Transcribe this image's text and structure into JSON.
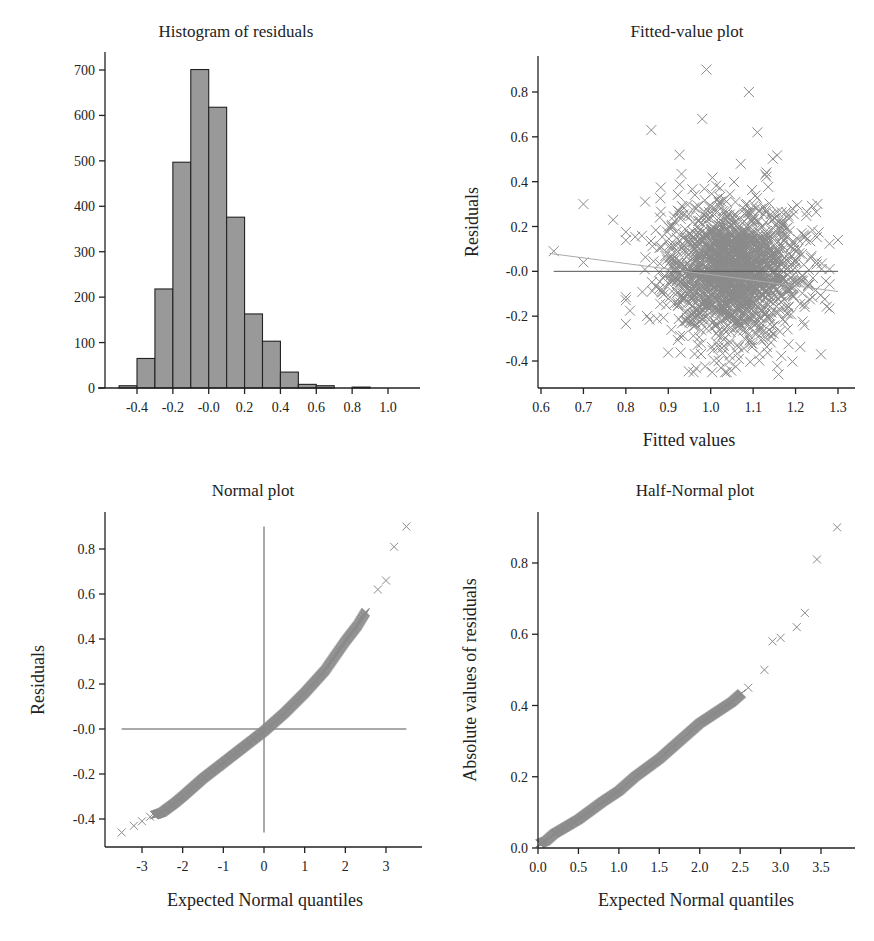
{
  "chart_data": [
    {
      "id": "histogram",
      "type": "bar",
      "title": "Histogram of residuals",
      "xlabel": "",
      "ylabel": "",
      "bin_edges": [
        -0.5,
        -0.4,
        -0.3,
        -0.2,
        -0.1,
        0.0,
        0.1,
        0.2,
        0.3,
        0.4,
        0.5,
        0.6,
        0.7,
        0.8,
        0.9
      ],
      "categories": [
        "-0.5 to -0.4",
        "-0.4 to -0.3",
        "-0.3 to -0.2",
        "-0.2 to -0.1",
        "-0.1 to 0.0",
        "0.0 to 0.1",
        "0.1 to 0.2",
        "0.2 to 0.3",
        "0.3 to 0.4",
        "0.4 to 0.5",
        "0.5 to 0.6",
        "0.6 to 0.7",
        "0.7 to 0.8",
        "0.8 to 0.9"
      ],
      "values": [
        5,
        65,
        218,
        497,
        701,
        618,
        376,
        163,
        103,
        35,
        8,
        5,
        0,
        2
      ],
      "xticks": [
        "-0.4",
        "-0.2",
        "-0.0",
        "0.2",
        "0.4",
        "0.6",
        "0.8",
        "1.0"
      ],
      "yticks": [
        "0",
        "100",
        "200",
        "300",
        "400",
        "500",
        "600",
        "700"
      ],
      "xlim": [
        -0.55,
        1.15
      ],
      "ylim": [
        0,
        740
      ],
      "grid": false
    },
    {
      "id": "fitted",
      "type": "scatter",
      "title": "Fitted-value plot",
      "xlabel": "Fitted values",
      "ylabel": "Residuals",
      "xticks": [
        "0.6",
        "0.7",
        "0.8",
        "0.9",
        "1.0",
        "1.1",
        "1.2",
        "1.3"
      ],
      "yticks": [
        "-0.4",
        "-0.2",
        "-0.0",
        "0.2",
        "0.4",
        "0.6",
        "0.8"
      ],
      "xlim": [
        0.59,
        1.34
      ],
      "ylim": [
        -0.53,
        0.97
      ],
      "marker": "x",
      "reference_line": {
        "y": 0.0,
        "x_from": 0.63,
        "x_to": 1.3
      },
      "trend_line": {
        "x": [
          0.62,
          1.3
        ],
        "y": [
          0.08,
          -0.09
        ]
      },
      "cloud_center": {
        "x": 1.05,
        "y": 0.0
      },
      "cloud_spread": {
        "x_sd": 0.08,
        "y_sd": 0.16
      },
      "notable_points": [
        {
          "x": 0.99,
          "y": 0.9
        },
        {
          "x": 1.09,
          "y": 0.8
        },
        {
          "x": 0.98,
          "y": 0.68
        },
        {
          "x": 0.86,
          "y": 0.63
        },
        {
          "x": 1.11,
          "y": 0.62
        },
        {
          "x": 0.7,
          "y": 0.3
        },
        {
          "x": 0.63,
          "y": 0.09
        },
        {
          "x": 0.7,
          "y": 0.04
        },
        {
          "x": 0.77,
          "y": 0.23
        },
        {
          "x": 1.16,
          "y": -0.46
        },
        {
          "x": 1.26,
          "y": -0.37
        },
        {
          "x": 1.3,
          "y": 0.14
        }
      ]
    },
    {
      "id": "normal",
      "type": "scatter",
      "title": "Normal plot",
      "xlabel": "Expected Normal quantiles",
      "ylabel": "Residuals",
      "xticks": [
        "-3",
        "-2",
        "-1",
        "0",
        "1",
        "2",
        "3"
      ],
      "yticks": [
        "-0.4",
        "-0.2",
        "-0.0",
        "0.2",
        "0.4",
        "0.6",
        "0.8"
      ],
      "xlim": [
        -3.8,
        3.8
      ],
      "ylim": [
        -0.52,
        0.97
      ],
      "marker": "x",
      "reference_lines": [
        {
          "y": 0.0,
          "x_from": -3.5,
          "x_to": 3.5
        },
        {
          "x": 0.0,
          "y_from": -0.46,
          "y_to": 0.9
        }
      ],
      "x": [
        -3.5,
        -3.2,
        -3.0,
        -2.8,
        -2.5,
        -2.2,
        -2.0,
        -1.5,
        -1.0,
        -0.5,
        0.0,
        0.5,
        1.0,
        1.5,
        2.0,
        2.3,
        2.6,
        2.8,
        3.0,
        3.2,
        3.5
      ],
      "y": [
        -0.46,
        -0.43,
        -0.41,
        -0.39,
        -0.37,
        -0.33,
        -0.3,
        -0.22,
        -0.15,
        -0.08,
        -0.01,
        0.07,
        0.16,
        0.26,
        0.39,
        0.46,
        0.55,
        0.62,
        0.66,
        0.81,
        0.9
      ]
    },
    {
      "id": "half_normal",
      "type": "scatter",
      "title": "Half-Normal plot",
      "xlabel": "Expected Normal quantiles",
      "ylabel": "Absolute values of residuals",
      "xticks": [
        "0.0",
        "0.5",
        "1.0",
        "1.5",
        "2.0",
        "2.5",
        "3.0",
        "3.5"
      ],
      "yticks": [
        "0.0",
        "0.2",
        "0.4",
        "0.6",
        "0.8"
      ],
      "xlim": [
        0.0,
        3.9
      ],
      "ylim": [
        0.0,
        0.95
      ],
      "marker": "x",
      "x": [
        0.0,
        0.1,
        0.2,
        0.5,
        0.8,
        1.0,
        1.2,
        1.5,
        1.8,
        2.0,
        2.2,
        2.4,
        2.6,
        2.8,
        2.9,
        3.0,
        3.2,
        3.3,
        3.45,
        3.7
      ],
      "y": [
        0.01,
        0.02,
        0.04,
        0.08,
        0.13,
        0.16,
        0.2,
        0.25,
        0.31,
        0.35,
        0.38,
        0.41,
        0.45,
        0.5,
        0.58,
        0.59,
        0.62,
        0.66,
        0.81,
        0.9
      ]
    }
  ],
  "panels": {
    "histogram": {
      "title": "Histogram of residuals"
    },
    "fitted": {
      "title": "Fitted-value plot",
      "xlabel": "Fitted values",
      "ylabel": "Residuals"
    },
    "normal": {
      "title": "Normal plot",
      "xlabel": "Expected Normal quantiles",
      "ylabel": "Residuals"
    },
    "half_normal": {
      "title": "Half-Normal plot",
      "xlabel": "Expected Normal quantiles",
      "ylabel": "Absolute values of residuals"
    }
  },
  "colors": {
    "bar_fill": "#999999",
    "point": "#8a8a8a",
    "axis": "#222222",
    "reference_line": "#555555"
  }
}
